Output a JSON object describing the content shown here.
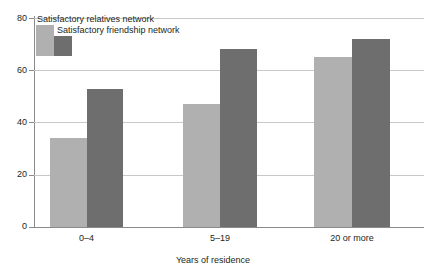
{
  "chart_data": {
    "type": "bar",
    "title": "",
    "xlabel": "Years of residence",
    "ylabel": "",
    "categories": [
      "0–4",
      "5–19",
      "20 or more"
    ],
    "series": [
      {
        "name": "Satisfactory relatives network",
        "color": "#b0b0b0",
        "values": [
          34,
          47,
          65
        ]
      },
      {
        "name": "Satisfactory friendship network",
        "color": "#6e6e6e",
        "values": [
          53,
          68,
          72
        ]
      }
    ],
    "ylim": [
      0,
      80
    ],
    "yticks": [
      0,
      20,
      40,
      60,
      80
    ],
    "ytick_labels": [
      "0",
      "20",
      "40",
      "60",
      "80"
    ],
    "grid": "horizontal",
    "legend_position": "top-left"
  },
  "axis": {
    "y": {
      "t80": "80",
      "t60": "60",
      "t40": "40",
      "t20": "20",
      "t0": "0"
    },
    "x": {
      "title": "Years of residence",
      "cat0": "0–4",
      "cat1": "5–19",
      "cat2": "20 or more"
    }
  },
  "legend": {
    "item0": "Satisfactory relatives network",
    "item1": "Satisfactory friendship network"
  }
}
